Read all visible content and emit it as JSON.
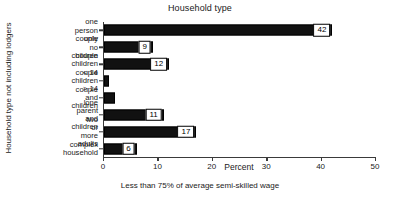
{
  "chart_data": {
    "type": "bar",
    "orientation": "horizontal",
    "title": "Household type",
    "xlabel": "Percent",
    "ylabel": "Household type not including lodgers",
    "caption": "Less than 75% of average semi-skilled wage",
    "categories": [
      "one person only",
      "couple no children",
      "couple children < 14",
      "couple children > 14",
      "couple and children",
      "lone parent and\nchildren",
      "two or more adults",
      "complex household"
    ],
    "values": [
      42,
      9,
      12,
      1,
      2,
      11,
      17,
      6
    ],
    "value_labels": [
      "42",
      "9",
      "12",
      "",
      "",
      "11",
      "17",
      "6"
    ],
    "xlim": [
      0,
      50
    ],
    "xticks": [
      0,
      10,
      20,
      30,
      40,
      50
    ],
    "xtick_labels": [
      "0",
      "10",
      "20",
      "30",
      "40",
      "50"
    ],
    "grid": false,
    "legend": false,
    "bar_color": "#111111"
  }
}
